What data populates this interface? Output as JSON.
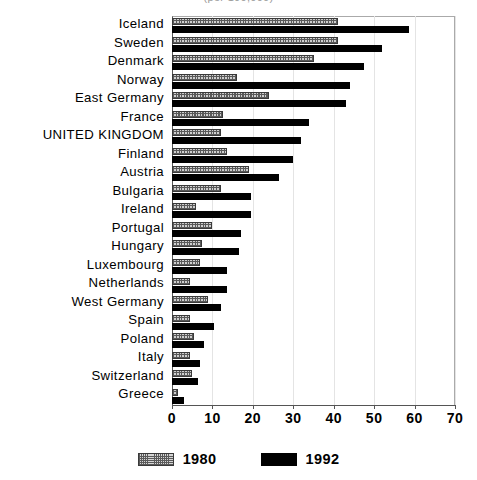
{
  "figure": {
    "title_clipped": "(per 100,000)",
    "background": "#ffffff"
  },
  "legend": {
    "position": "bottom-center",
    "entries": [
      {
        "label": "1980",
        "swatch": "hatched-gray-swatch",
        "color": "#cfcfcf"
      },
      {
        "label": "1992",
        "swatch": "solid-black-swatch",
        "color": "#000000"
      }
    ]
  },
  "chart_data": {
    "type": "bar",
    "orientation": "horizontal",
    "title": "",
    "xlabel": "",
    "ylabel": "",
    "xlim": [
      0,
      70
    ],
    "ylim": null,
    "grid": true,
    "legend_position": "bottom-center",
    "xticks": [
      0,
      10,
      20,
      30,
      40,
      50,
      60,
      70
    ],
    "xticklabels": [
      "0",
      "10",
      "20",
      "30",
      "40",
      "50",
      "60",
      "70"
    ],
    "categories": [
      "Iceland",
      "Sweden",
      "Denmark",
      "Norway",
      "East Germany",
      "France",
      "UNITED KINGDOM",
      "Finland",
      "Austria",
      "Bulgaria",
      "Ireland",
      "Portugal",
      "Hungary",
      "Luxembourg",
      "Netherlands",
      "West Germany",
      "Spain",
      "Poland",
      "Italy",
      "Switzerland",
      "Greece"
    ],
    "series": [
      {
        "name": "1980",
        "color": "#cfcfcf",
        "values": [
          41,
          41,
          35,
          16,
          24,
          12.5,
          12,
          13.5,
          19,
          12,
          6,
          10,
          7.5,
          7,
          4.5,
          9,
          4.5,
          5.5,
          4.5,
          5,
          1.5
        ]
      },
      {
        "name": "1992",
        "color": "#000000",
        "values": [
          58.5,
          52,
          47.5,
          44,
          43,
          34,
          32,
          30,
          26.5,
          19.5,
          19.5,
          17,
          16.5,
          13.5,
          13.5,
          12,
          10.5,
          8,
          7,
          6.5,
          3
        ]
      }
    ]
  }
}
